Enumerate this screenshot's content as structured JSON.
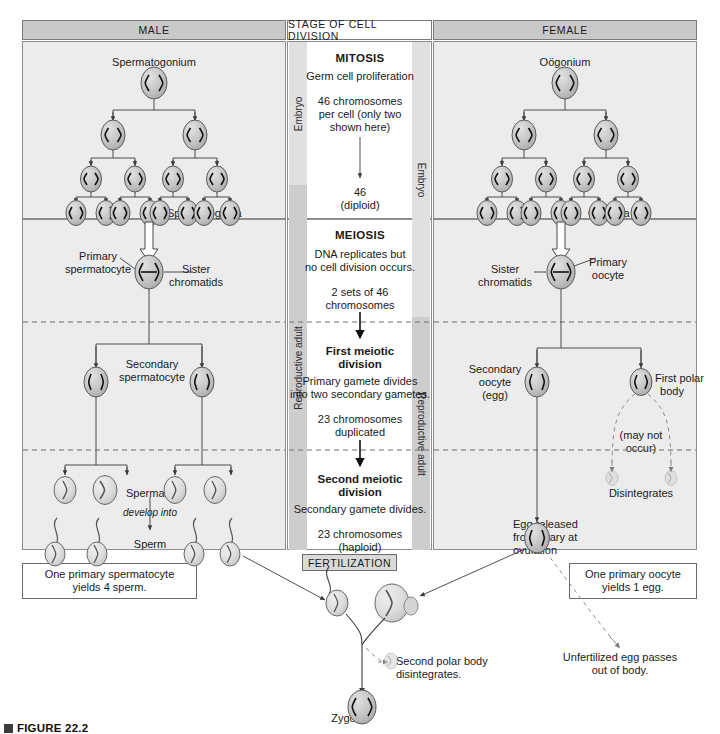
{
  "figure": {
    "headers": {
      "male": "MALE",
      "center": "STAGE OF CELL DIVISION",
      "female": "FEMALE"
    },
    "stage_bands": {
      "embryo": "Embryo",
      "reproductive_adult": "Reproductive adult"
    },
    "male": {
      "top_cell_label": "Spermatogonium",
      "tree_leaf_label": "Spermatogonia",
      "primary_label": "Primary\nspermatocyte",
      "primary_label_line1": "Primary",
      "primary_label_line2": "spermatocyte",
      "sister_chromatids_line1": "Sister",
      "sister_chromatids_line2": "chromatids",
      "secondary_label_line1": "Secondary",
      "secondary_label_line2": "spermatocyte",
      "spermatids_label": "Spermatids",
      "develop_into_label": "develop into",
      "sperm_label": "Sperm",
      "summary_line1": "One primary spermatocyte",
      "summary_line2": "yields 4 sperm."
    },
    "center": {
      "mitosis_title": "MITOSIS",
      "mitosis_sub": "Germ cell proliferation",
      "mitosis_note_line1": "46 chromosomes",
      "mitosis_note_line2": "per cell (only two",
      "mitosis_note_line3": "shown here)",
      "mitosis_result_line1": "46",
      "mitosis_result_line2": "(diploid)",
      "meiosis_title": "MEIOSIS",
      "meiosis_sub_line1": "DNA replicates but",
      "meiosis_sub_line2": "no cell division occurs.",
      "meiosis_note_line1": "2 sets of 46",
      "meiosis_note_line2": "chromosomes",
      "first_division_line1": "First meiotic",
      "first_division_line2": "division",
      "first_division_sub_line1": "Primary gamete divides",
      "first_division_sub_line2": "into two secondary gametes.",
      "first_result_line1": "23 chromosomes",
      "first_result_line2": "duplicated",
      "second_division_line1": "Second meiotic",
      "second_division_line2": "division",
      "second_division_sub": "Secondary gamete divides.",
      "second_result_line1": "23 chromosomes",
      "second_result_line2": "(haploid)"
    },
    "female": {
      "top_cell_label": "Oögonium",
      "tree_leaf_label": "Oögonia",
      "sister_chromatids_line1": "Sister",
      "sister_chromatids_line2": "chromatids",
      "primary_label_line1": "Primary",
      "primary_label_line2": "oocyte",
      "secondary_label_line1": "Secondary",
      "secondary_label_line2": "oocyte",
      "secondary_label_line3": "(egg)",
      "first_polar_line1": "First polar",
      "first_polar_line2": "body",
      "may_not_occur_line1": "(may not",
      "may_not_occur_line2": "occur)",
      "disintegrates_label": "Disintegrates",
      "egg_released_line1": "Egg released",
      "egg_released_line2": "from ovary at",
      "egg_released_line3": "ovulation",
      "summary_line1": "One primary oocyte",
      "summary_line2": "yields 1 egg.",
      "unfertilized_line1": "Unfertilized egg passes",
      "unfertilized_line2": "out of body."
    },
    "fertilization": {
      "banner": "FERTILIZATION",
      "second_polar_line1": "Second polar body",
      "second_polar_line2": "disintegrates.",
      "zygote_label": "Zygote"
    },
    "caption": {
      "prefix": "FIGURE 22.2"
    },
    "colors": {
      "header_gray": "#c9c9c9",
      "panel_bg": "#ececed",
      "band_light": "#e2e2e2",
      "band_dark": "#cfcfcf",
      "cell_fill": "#c4c4c4",
      "line": "#3b3b3b"
    }
  }
}
